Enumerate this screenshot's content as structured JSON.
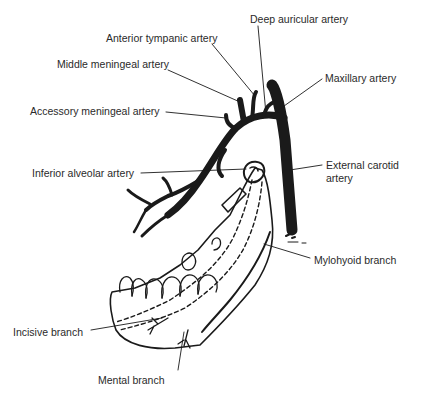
{
  "diagram": {
    "colors": {
      "ink": "#1a1a1a",
      "label": "#2a2a2a",
      "background": "#ffffff"
    },
    "labels": [
      {
        "id": "deep-auricular",
        "text": "Deep auricular artery",
        "x": 250,
        "y": 13
      },
      {
        "id": "anterior-tympanic",
        "text": "Anterior tympanic artery",
        "x": 106,
        "y": 32
      },
      {
        "id": "middle-meningeal",
        "text": "Middle meningeal artery",
        "x": 57,
        "y": 58
      },
      {
        "id": "maxillary",
        "text": "Maxillary artery",
        "x": 325,
        "y": 72
      },
      {
        "id": "accessory-meningeal",
        "text": "Accessory meningeal artery",
        "x": 30,
        "y": 105
      },
      {
        "id": "inferior-alveolar",
        "text": "Inferior alveolar artery",
        "x": 32,
        "y": 167
      },
      {
        "id": "external-carotid-1",
        "text": "External carotid",
        "x": 326,
        "y": 159
      },
      {
        "id": "external-carotid-2",
        "text": "artery",
        "x": 326,
        "y": 172
      },
      {
        "id": "mylohyoid",
        "text": "Mylohyoid branch",
        "x": 314,
        "y": 254
      },
      {
        "id": "incisive",
        "text": "Incisive branch",
        "x": 13,
        "y": 326
      },
      {
        "id": "mental",
        "text": "Mental branch",
        "x": 98,
        "y": 374
      }
    ]
  }
}
